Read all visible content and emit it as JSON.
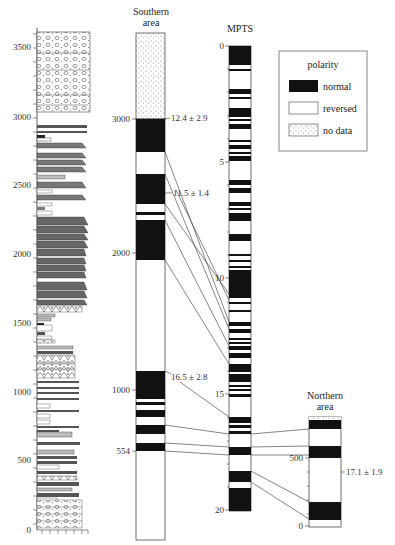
{
  "columns": {
    "lithology": {
      "axis_ticks": [
        "3500",
        "3000",
        "2500",
        "2000",
        "1500",
        "1000",
        "500",
        "0"
      ]
    },
    "southern": {
      "title_line1": "Southern",
      "title_line2": "area",
      "axis_ticks": [
        "3000",
        "2000",
        "1000",
        "554"
      ],
      "ages": [
        "12.4 ± 2.9",
        "11.5 ± 1.4",
        "16.5 ± 2.8"
      ]
    },
    "mpts": {
      "title": "MPTS",
      "axis_ticks": [
        "0",
        "5",
        "10",
        "15",
        "20"
      ]
    },
    "northern": {
      "title_line1": "Northern",
      "title_line2": "area",
      "axis_ticks": [
        "500",
        "0"
      ],
      "ages": [
        "17.1 ± 1.9"
      ]
    }
  },
  "legend": {
    "title": "polarity",
    "items": [
      {
        "label": "normal",
        "pattern": "black"
      },
      {
        "label": "reversed",
        "pattern": "white"
      },
      {
        "label": "no data",
        "pattern": "stipple"
      }
    ]
  },
  "colors": {
    "normal": "#111111",
    "reversed": "#ffffff",
    "line": "#333333"
  }
}
